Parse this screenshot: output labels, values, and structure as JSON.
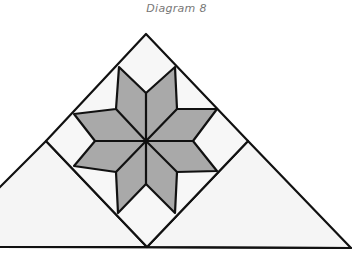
{
  "caption": "Diagram 8",
  "colors": {
    "outline": "#111111",
    "star_fill": "#a9a9a9",
    "background_piece_fill": "#f5f5f5",
    "caption": "#777777"
  },
  "diagram": {
    "pieces": {
      "star_diamonds": 8,
      "corner_squares": 4,
      "side_triangles": 4,
      "setting_triangles": 2
    }
  }
}
